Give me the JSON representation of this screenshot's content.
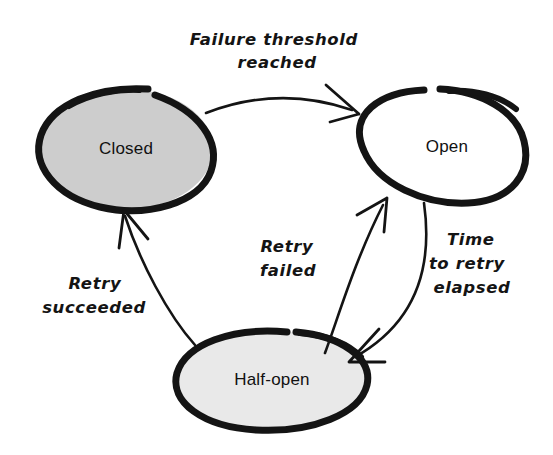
{
  "diagram": {
    "style": "hand-drawn sketch",
    "background_color": "#ffffff",
    "ink_color": "#141414",
    "states": [
      {
        "id": "closed",
        "label": "Closed",
        "fill_color": "#cdcdcd",
        "outline_color": "#141414",
        "cx": 126,
        "cy": 149,
        "rx": 88,
        "ry": 61
      },
      {
        "id": "open",
        "label": "Open",
        "fill_color": "#ffffff",
        "outline_color": "#141414",
        "cx": 445,
        "cy": 147,
        "rx": 82,
        "ry": 59
      },
      {
        "id": "half-open",
        "label": "Half-open",
        "fill_color": "#e9e9e9",
        "outline_color": "#141414",
        "cx": 272,
        "cy": 380,
        "rx": 97,
        "ry": 50
      }
    ],
    "transitions": [
      {
        "id": "closed-to-open",
        "from": "closed",
        "to": "open",
        "label": "Failure threshold reached",
        "label_lines": [
          "Failure threshold",
          "reached"
        ],
        "label_x": 277,
        "label_y": 38
      },
      {
        "id": "open-to-half-open",
        "from": "open",
        "to": "half-open",
        "label": "Time to retry elapsed",
        "label_lines": [
          "Time",
          "to retry",
          "elapsed"
        ],
        "label_x": 470,
        "label_y": 240
      },
      {
        "id": "half-open-to-open",
        "from": "half-open",
        "to": "open",
        "label": "Retry failed",
        "label_lines": [
          "Retry",
          "failed"
        ],
        "label_x": 288,
        "label_y": 245
      },
      {
        "id": "half-open-to-closed",
        "from": "half-open",
        "to": "closed",
        "label": "Retry succeeded",
        "label_lines": [
          "Retry",
          "succeeded"
        ],
        "label_x": 94,
        "label_y": 282
      }
    ]
  }
}
